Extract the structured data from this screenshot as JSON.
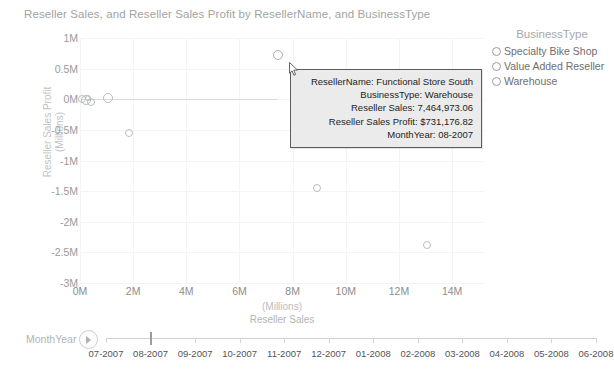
{
  "header": {
    "title": "Reseller Sales, and Reseller Sales Profit by ResellerName, and BusinessType"
  },
  "chart_data": {
    "type": "scatter",
    "title": "Reseller Sales, and Reseller Sales Profit by ResellerName, and BusinessType",
    "xlabel_line1": "(Millions)",
    "xlabel_line2": "Reseller Sales",
    "ylabel_line1": "Reseller Sales Profit",
    "ylabel_line2": "(Millions)",
    "xlim": [
      0,
      15.2
    ],
    "ylim": [
      -3,
      1
    ],
    "xticks": [
      "0M",
      "2M",
      "4M",
      "6M",
      "8M",
      "10M",
      "12M",
      "14M"
    ],
    "xtick_values": [
      0,
      2,
      4,
      6,
      8,
      10,
      12,
      14
    ],
    "ytick_values": [
      1,
      0.5,
      0,
      -0.5,
      -1,
      -1.5,
      -2,
      -2.5,
      -3
    ],
    "yticks": [
      "1M",
      "0.5M",
      "0M",
      "-0.5M",
      "-1M",
      "-1.5M",
      "-2M",
      "-2.5M",
      "-3M"
    ],
    "grid": true,
    "legend_position": "right",
    "marker_style": "open-circle",
    "points": [
      {
        "x": 0.08,
        "y": 0.01,
        "r": 4,
        "label": "cluster-a"
      },
      {
        "x": 0.22,
        "y": -0.02,
        "r": 5,
        "label": "cluster-b"
      },
      {
        "x": 0.3,
        "y": 0.02,
        "r": 3,
        "label": "cluster-c"
      },
      {
        "x": 0.42,
        "y": -0.05,
        "r": 4,
        "label": "cluster-d"
      },
      {
        "x": 1.05,
        "y": 0.02,
        "r": 5,
        "label": "point-near-zero"
      },
      {
        "x": 1.85,
        "y": -0.55,
        "r": 4,
        "label": "point-mid-low"
      },
      {
        "x": 7.46,
        "y": 0.73,
        "r": 5,
        "label": "Functional Store South",
        "hovered": true
      },
      {
        "x": 8.9,
        "y": -1.45,
        "r": 4,
        "label": "point-lower-mid"
      },
      {
        "x": 13.05,
        "y": -2.38,
        "r": 4,
        "label": "point-lower-right"
      }
    ],
    "baseline": {
      "y": 0,
      "x_from": 0.08,
      "x_to": 7.46
    },
    "legend": {
      "title": "BusinessType",
      "entries": [
        "Specialty Bike Shop",
        "Value Added Reseller",
        "Warehouse"
      ]
    }
  },
  "tooltip": {
    "rows": [
      "ResellerName: Functional Store South",
      "BusinessType: Warehouse",
      "Reseller Sales: 7,464,973.06",
      "Reseller Sales Profit: $731,176.82",
      "MonthYear: 08-2007"
    ]
  },
  "timeline": {
    "label": "MonthYear",
    "play_icon": "play-icon",
    "selected": "08-2007",
    "ticks": [
      "07-2007",
      "08-2007",
      "09-2007",
      "10-2007",
      "11-2007",
      "12-2007",
      "01-2008",
      "02-2008",
      "03-2008",
      "04-2008",
      "05-2008",
      "06-2008"
    ]
  },
  "colors": {
    "title": "#a3a3a3",
    "axis_text": "#8d8d8d",
    "marker_stroke": "#b9bdc2",
    "grid": "#f4f4f4",
    "tooltip_bg": "#ebebeb",
    "tooltip_border": "#5c5c5c"
  }
}
